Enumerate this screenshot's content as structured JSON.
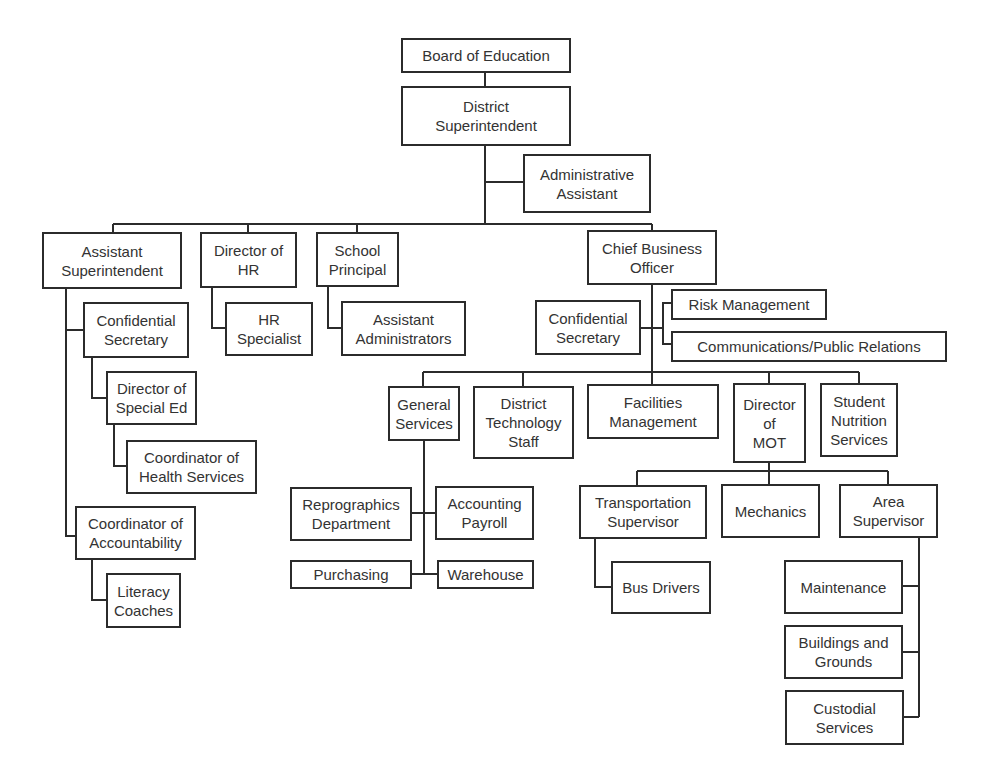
{
  "chart": {
    "type": "org-chart",
    "nodes": {
      "board": "Board of Education",
      "district_superintendent": "District\nSuperintendent",
      "administrative_assistant": "Administrative\nAssistant",
      "assistant_superintendent": "Assistant\nSuperintendent",
      "director_hr": "Director of\nHR",
      "school_principal": "School\nPrincipal",
      "chief_business_officer": "Chief Business\nOfficer",
      "confidential_secretary_as": "Confidential\nSecretary",
      "director_special_ed": "Director of\nSpecial Ed",
      "coordinator_health": "Coordinator of\nHealth Services",
      "coordinator_accountability": "Coordinator of\nAccountability",
      "literacy_coaches": "Literacy\nCoaches",
      "hr_specialist": "HR\nSpecialist",
      "assistant_administrators": "Assistant\nAdministrators",
      "confidential_secretary_cbo": "Confidential\nSecretary",
      "risk_management": "Risk Management",
      "communications": "Communications/Public Relations",
      "general_services": "General\nServices",
      "district_technology": "District\nTechnology\nStaff",
      "facilities_management": "Facilities\nManagement",
      "director_mot": "Director\nof\nMOT",
      "student_nutrition": "Student\nNutrition\nServices",
      "reprographics": "Reprographics\nDepartment",
      "accounting_payroll": "Accounting\nPayroll",
      "purchasing": "Purchasing",
      "warehouse": "Warehouse",
      "transportation_supervisor": "Transportation\nSupervisor",
      "mechanics": "Mechanics",
      "area_supervisor": "Area\nSupervisor",
      "bus_drivers": "Bus Drivers",
      "maintenance": "Maintenance",
      "buildings_grounds": "Buildings and\nGrounds",
      "custodial_services": "Custodial\nServices"
    },
    "hierarchy": [
      {
        "parent": "Board of Education",
        "children": [
          "District Superintendent"
        ]
      },
      {
        "parent": "District Superintendent",
        "children": [
          "Administrative Assistant",
          "Assistant Superintendent",
          "Director of HR",
          "School Principal",
          "Chief Business Officer"
        ]
      },
      {
        "parent": "Assistant Superintendent",
        "children": [
          "Confidential Secretary",
          "Coordinator of Accountability"
        ]
      },
      {
        "parent": "Confidential Secretary",
        "children": [
          "Director of Special Ed"
        ]
      },
      {
        "parent": "Director of Special Ed",
        "children": [
          "Coordinator of Health Services"
        ]
      },
      {
        "parent": "Coordinator of Accountability",
        "children": [
          "Literacy Coaches"
        ]
      },
      {
        "parent": "Director of HR",
        "children": [
          "HR Specialist"
        ]
      },
      {
        "parent": "School Principal",
        "children": [
          "Assistant Administrators"
        ]
      },
      {
        "parent": "Chief Business Officer",
        "children": [
          "Confidential Secretary",
          "Risk Management",
          "Communications/Public Relations",
          "General Services",
          "District Technology Staff",
          "Facilities Management",
          "Director of MOT",
          "Student Nutrition Services"
        ]
      },
      {
        "parent": "General Services",
        "children": [
          "Reprographics Department",
          "Accounting Payroll",
          "Purchasing",
          "Warehouse"
        ]
      },
      {
        "parent": "Director of MOT",
        "children": [
          "Transportation Supervisor",
          "Mechanics",
          "Area Supervisor"
        ]
      },
      {
        "parent": "Transportation Supervisor",
        "children": [
          "Bus Drivers"
        ]
      },
      {
        "parent": "Area Supervisor",
        "children": [
          "Maintenance",
          "Buildings and Grounds",
          "Custodial Services"
        ]
      }
    ]
  },
  "colors": {
    "line": "#2b2b2b",
    "text": "#333333",
    "background": "#ffffff"
  }
}
